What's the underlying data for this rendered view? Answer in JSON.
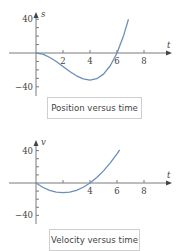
{
  "chart_data": [
    {
      "type": "line",
      "title": "Position versus time",
      "xlabel": "t",
      "ylabel": "s",
      "xlim": [
        0,
        10
      ],
      "ylim": [
        -45,
        45
      ],
      "x_ticks": [
        2,
        4,
        6,
        8
      ],
      "x_tick_labels": [
        "2",
        "4",
        "6",
        "8"
      ],
      "y_ticks": [
        -40,
        -30,
        -20,
        -10,
        10,
        20,
        30,
        40
      ],
      "y_tick_labels": [
        "-40",
        "40"
      ],
      "grid": false,
      "line_color": "#6a8fb8",
      "series": [
        {
          "name": "s(t)",
          "x": [
            0,
            0.5,
            1,
            1.5,
            2,
            2.5,
            3,
            3.5,
            4,
            4.5,
            5,
            5.5,
            6,
            6.5,
            6.85
          ],
          "values": [
            0,
            -1.4,
            -5,
            -10.1,
            -16,
            -21.9,
            -27,
            -30.6,
            -32,
            -30.4,
            -25,
            -15.1,
            0,
            21.1,
            39.9
          ]
        }
      ]
    },
    {
      "type": "line",
      "title": "Velocity versus time",
      "xlabel": "t",
      "ylabel": "v",
      "xlim": [
        0,
        10
      ],
      "ylim": [
        -45,
        45
      ],
      "x_ticks": [
        2,
        4,
        6,
        8
      ],
      "x_tick_labels": [
        "",
        "4",
        "6",
        "8"
      ],
      "y_ticks": [
        -40,
        -30,
        -20,
        -10,
        10,
        20,
        30,
        40
      ],
      "y_tick_labels": [
        "-40",
        "40"
      ],
      "grid": false,
      "line_color": "#6a8fb8",
      "series": [
        {
          "name": "v(t)",
          "x": [
            0,
            0.5,
            1,
            1.5,
            2,
            2.5,
            3,
            3.5,
            4,
            4.5,
            5,
            5.5,
            6,
            6.2
          ],
          "values": [
            0,
            -5.25,
            -9,
            -11.25,
            -12,
            -11.25,
            -9,
            -5.25,
            0,
            6.75,
            15,
            24.75,
            36,
            40.9
          ]
        }
      ]
    }
  ]
}
